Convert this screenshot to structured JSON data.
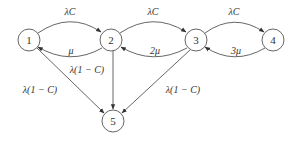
{
  "diagram": {
    "type": "state-transition",
    "colors": {
      "stroke": "#555555",
      "text": "#333333",
      "background": "#ffffff"
    },
    "nodes": [
      {
        "id": "1",
        "label": "1",
        "x": 29,
        "y": 40
      },
      {
        "id": "2",
        "label": "2",
        "x": 111,
        "y": 40
      },
      {
        "id": "3",
        "label": "3",
        "x": 196,
        "y": 40
      },
      {
        "id": "4",
        "label": "4",
        "x": 273,
        "y": 40
      },
      {
        "id": "5",
        "label": "5",
        "x": 113,
        "y": 121
      }
    ],
    "edges": [
      {
        "from": "1",
        "to": "2",
        "label": "λC"
      },
      {
        "from": "2",
        "to": "1",
        "label": "μ"
      },
      {
        "from": "2",
        "to": "3",
        "label": "λC"
      },
      {
        "from": "3",
        "to": "2",
        "label": "2μ"
      },
      {
        "from": "3",
        "to": "4",
        "label": "λC"
      },
      {
        "from": "4",
        "to": "3",
        "label": "3μ"
      },
      {
        "from": "1",
        "to": "5",
        "label": "λ(1 − C)"
      },
      {
        "from": "2",
        "to": "5",
        "label": "λ(1 − C)"
      },
      {
        "from": "3",
        "to": "5",
        "label": "λ(1 − C)"
      }
    ]
  }
}
